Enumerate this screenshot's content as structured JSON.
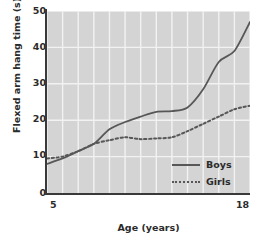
{
  "chart_data": {
    "type": "line",
    "title": "",
    "xlabel": "Age (years)",
    "ylabel": "Flexed arm hang time (s)",
    "xlim": [
      5,
      18
    ],
    "ylim": [
      0,
      50
    ],
    "xticks": [
      "5",
      "18"
    ],
    "yticks": [
      "0",
      "10",
      "20",
      "30",
      "40",
      "50"
    ],
    "grid": true,
    "legend_position": "bottom-right",
    "x": [
      5,
      6,
      7,
      8,
      9,
      10,
      11,
      12,
      13,
      14,
      15,
      16,
      17,
      18
    ],
    "series": [
      {
        "name": "Boys",
        "style": "solid",
        "color": "#575757",
        "values": [
          8.0,
          9.5,
          11.5,
          13.5,
          17.5,
          19.5,
          21.0,
          22.3,
          22.5,
          23.5,
          28.5,
          36.0,
          39.0,
          47.0
        ]
      },
      {
        "name": "Girls",
        "style": "dotted",
        "color": "#575757",
        "values": [
          9.5,
          10.0,
          11.5,
          13.5,
          14.5,
          15.3,
          14.8,
          15.0,
          15.3,
          17.0,
          19.0,
          21.0,
          23.0,
          24.0
        ]
      }
    ]
  },
  "legend": {
    "boys_label": "Boys",
    "girls_label": "Girls"
  },
  "colors": {
    "plot_background": "#d4d4d4",
    "gridline": "#f2f2f2",
    "axis": "#3a3a3a",
    "line": "#575757",
    "text": "#2b2b2b"
  }
}
